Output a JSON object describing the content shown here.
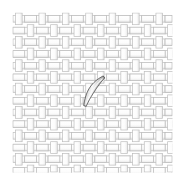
{
  "figure": {
    "width": 184,
    "height": 184,
    "background_color": "#ffffff"
  },
  "weave": {
    "pattern_name": "basket-weave",
    "description": "Orthogonal interlaced strips forming a plain / basket weave grid",
    "origin_x": 13,
    "origin_y": 13,
    "extent_x": 172,
    "extent_y": 172,
    "cell_period": 11.7,
    "strip_thickness": 6.6,
    "columns": 14,
    "rows": 14,
    "strip_fill_color": "#fdfdfd",
    "strip_stroke_color": "#bdbdbd",
    "strip_stroke_width": 0.7,
    "shadow_color": "#d9d9d9",
    "grid_tint_color": "#f2f2f2"
  },
  "fiber": {
    "label": "curved-fiber",
    "description": "Single elongated curved fiber lying diagonally over the weave",
    "start_x": 104,
    "start_y": 77,
    "end_x": 85,
    "end_y": 106,
    "length": 35,
    "max_width": 6,
    "outline_color": "#4a4a4a",
    "outline_width": 0.9,
    "fill_light": "#f4f4f4",
    "fill_mid": "#b9b9b9",
    "fill_dark": "#8a8a8a",
    "highlight_color": "#fafafa"
  },
  "annotations": {
    "caption": "",
    "scale_bar": "",
    "legend": ""
  }
}
